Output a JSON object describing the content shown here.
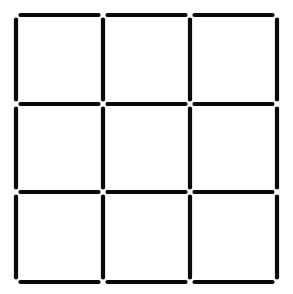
{
  "diagram": {
    "type": "matchstick-grid",
    "rows": 3,
    "cols": 3,
    "total_squares": 9,
    "total_sticks": 24,
    "colors": {
      "stick": "#0a0a0a",
      "background": "#ffffff"
    },
    "horizontal_sticks": [
      {
        "row_line": 0,
        "col": 0
      },
      {
        "row_line": 0,
        "col": 1
      },
      {
        "row_line": 0,
        "col": 2
      },
      {
        "row_line": 1,
        "col": 0
      },
      {
        "row_line": 1,
        "col": 1
      },
      {
        "row_line": 1,
        "col": 2
      },
      {
        "row_line": 2,
        "col": 0
      },
      {
        "row_line": 2,
        "col": 1
      },
      {
        "row_line": 2,
        "col": 2
      },
      {
        "row_line": 3,
        "col": 0
      },
      {
        "row_line": 3,
        "col": 1
      },
      {
        "row_line": 3,
        "col": 2
      }
    ],
    "vertical_sticks": [
      {
        "col_line": 0,
        "row": 0
      },
      {
        "col_line": 1,
        "row": 0
      },
      {
        "col_line": 2,
        "row": 0
      },
      {
        "col_line": 3,
        "row": 0
      },
      {
        "col_line": 0,
        "row": 1
      },
      {
        "col_line": 1,
        "row": 1
      },
      {
        "col_line": 2,
        "row": 1
      },
      {
        "col_line": 3,
        "row": 1
      },
      {
        "col_line": 0,
        "row": 2
      },
      {
        "col_line": 1,
        "row": 2
      },
      {
        "col_line": 2,
        "row": 2
      },
      {
        "col_line": 3,
        "row": 2
      }
    ]
  }
}
